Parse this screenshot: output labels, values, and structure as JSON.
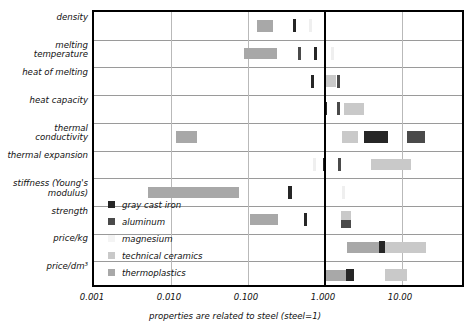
{
  "chart_data": {
    "type": "bar",
    "title": "",
    "subtitle": "",
    "xlabel": "properties are related to steel (steel=1)",
    "ylabel": "",
    "scale": "log",
    "xlim": [
      0.001,
      50
    ],
    "xticks": [
      0.001,
      0.01,
      0.1,
      1.0,
      10.0
    ],
    "xtick_labels": [
      "0.001",
      "0.010",
      "0.100",
      "1.000",
      "10.00"
    ],
    "grid": true,
    "reference_line": {
      "value": 1.0,
      "label": "steel=1",
      "color": "#000000"
    },
    "legend_position": "inside-lower-left",
    "categories": [
      "density",
      "melting\ntemperature",
      "heat of melting",
      "heat capacity",
      "thermal\nconductivity",
      "thermal expansion",
      "stiffness (Young's\nmodulus)",
      "strength",
      "price/kg",
      "price/dm³"
    ],
    "series": [
      {
        "name": "gray cast iron",
        "color": "#262626"
      },
      {
        "name": "aluminum",
        "color": "#4a4a4a"
      },
      {
        "name": "magnesium",
        "color": "#efefef"
      },
      {
        "name": "technical ceramics",
        "color": "#c9c9c9"
      },
      {
        "name": "thermoplastics",
        "color": "#a8a8a8"
      }
    ],
    "bars": [
      {
        "row": 0,
        "material": "thermoplastics",
        "min": 0.13,
        "max": 0.21
      },
      {
        "row": 0,
        "material": "gray cast iron",
        "min": 0.38,
        "max": 0.42
      },
      {
        "row": 0,
        "material": "magnesium",
        "min": 0.62,
        "max": 0.66
      },
      {
        "row": 1,
        "material": "thermoplastics",
        "min": 0.09,
        "max": 0.235
      },
      {
        "row": 1,
        "material": "aluminum",
        "min": 0.44,
        "max": 0.47
      },
      {
        "row": 1,
        "material": "gray cast iron",
        "min": 0.72,
        "max": 0.78
      },
      {
        "row": 1,
        "material": "magnesium",
        "min": 1.18,
        "max": 1.24
      },
      {
        "row": 2,
        "material": "gray cast iron",
        "min": 0.65,
        "max": 0.7
      },
      {
        "row": 2,
        "material": "technical ceramics",
        "min": 1.02,
        "max": 1.38
      },
      {
        "row": 2,
        "material": "aluminum",
        "min": 1.43,
        "max": 1.51
      },
      {
        "row": 3,
        "material": "gray cast iron",
        "min": 0.96,
        "max": 1.01
      },
      {
        "row": 3,
        "material": "aluminum",
        "min": 1.44,
        "max": 1.52
      },
      {
        "row": 3,
        "material": "technical ceramics",
        "min": 1.75,
        "max": 3.2
      },
      {
        "row": 4,
        "material": "thermoplastics",
        "min": 0.0115,
        "max": 0.0215
      },
      {
        "row": 4,
        "material": "technical ceramics",
        "min": 1.65,
        "max": 2.7
      },
      {
        "row": 4,
        "material": "gray cast iron",
        "min": 3.2,
        "max": 6.5
      },
      {
        "row": 4,
        "material": "aluminum",
        "min": 11.5,
        "max": 20.0
      },
      {
        "row": 5,
        "material": "magnesium",
        "min": 0.7,
        "max": 0.74
      },
      {
        "row": 5,
        "material": "gray cast iron",
        "min": 0.93,
        "max": 0.99
      },
      {
        "row": 5,
        "material": "aluminum",
        "min": 1.48,
        "max": 1.6
      },
      {
        "row": 5,
        "material": "technical ceramics",
        "min": 3.9,
        "max": 13.0
      },
      {
        "row": 6,
        "material": "thermoplastics",
        "min": 0.005,
        "max": 0.076
      },
      {
        "row": 6,
        "material": "gray cast iron",
        "min": 0.33,
        "max": 0.37
      },
      {
        "row": 6,
        "material": "magnesium",
        "min": 1.65,
        "max": 1.72
      },
      {
        "row": 7,
        "material": "thermoplastics",
        "min": 0.105,
        "max": 0.245
      },
      {
        "row": 7,
        "material": "gray cast iron",
        "min": 0.53,
        "max": 0.58
      },
      {
        "row": 7,
        "material": "technical ceramics",
        "min": 1.62,
        "max": 2.15
      },
      {
        "row": 7,
        "material": "aluminum",
        "min": 1.62,
        "max": 2.15
      },
      {
        "row": 8,
        "material": "thermoplastics",
        "min": 1.95,
        "max": 12.8
      },
      {
        "row": 8,
        "material": "technical ceramics",
        "min": 6.1,
        "max": 20.5
      },
      {
        "row": 8,
        "material": "gray cast iron",
        "min": 5.0,
        "max": 6.1
      },
      {
        "row": 9,
        "material": "thermoplastics",
        "min": 1.0,
        "max": 2.35
      },
      {
        "row": 9,
        "material": "technical ceramics",
        "min": 6.1,
        "max": 11.5
      },
      {
        "row": 9,
        "material": "gray cast iron",
        "min": 1.9,
        "max": 2.35
      }
    ]
  },
  "legend": {
    "items": [
      {
        "label": "gray cast iron",
        "color": "#262626"
      },
      {
        "label": "aluminum",
        "color": "#4a4a4a"
      },
      {
        "label": "magnesium",
        "color": "#f4f4f4"
      },
      {
        "label": "technical ceramics",
        "color": "#c9c9c9"
      },
      {
        "label": "thermoplastics",
        "color": "#a8a8a8"
      }
    ]
  },
  "axis": {
    "x_title": "properties are related to steel (steel=1)",
    "ticks": [
      "0.001",
      "0.010",
      "0.100",
      "1.000",
      "10.00"
    ]
  },
  "rows": [
    {
      "label": "density"
    },
    {
      "label": "melting\ntemperature"
    },
    {
      "label": "heat of melting"
    },
    {
      "label": "heat capacity"
    },
    {
      "label": "thermal\nconductivity"
    },
    {
      "label": "thermal expansion"
    },
    {
      "label": "stiffness (Young's\nmodulus)"
    },
    {
      "label": "strength"
    },
    {
      "label": "price/kg"
    },
    {
      "label": "price/dm³"
    }
  ]
}
